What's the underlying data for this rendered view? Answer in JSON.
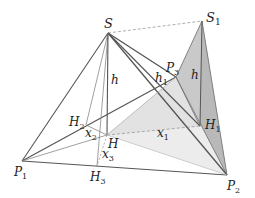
{
  "diagram": {
    "colors": {
      "edge": "#555555",
      "thin_edge": "#888888",
      "dashed": "#999999",
      "face_dark": "#c8c8c8",
      "face_light": "#ebebeb"
    },
    "points": {
      "S": {
        "label": "S",
        "sub": "",
        "x": 108,
        "y": 33
      },
      "S1": {
        "label": "S",
        "sub": "1",
        "x": 202,
        "y": 21
      },
      "P1": {
        "label": "P",
        "sub": "1",
        "x": 22,
        "y": 161
      },
      "P2": {
        "label": "P",
        "sub": "2",
        "x": 227,
        "y": 175
      },
      "P3": {
        "label": "P",
        "sub": "3",
        "x": 176,
        "y": 77
      },
      "H": {
        "label": "H",
        "sub": "",
        "x": 107,
        "y": 135
      },
      "H1": {
        "label": "H",
        "sub": "1",
        "x": 200,
        "y": 126
      },
      "H2": {
        "label": "H",
        "sub": "2",
        "x": 86,
        "y": 125
      },
      "H3": {
        "label": "H",
        "sub": "3",
        "x": 97,
        "y": 166
      }
    },
    "segment_labels": {
      "h_main": {
        "label": "h",
        "sub": ""
      },
      "h_S1": {
        "label": "h",
        "sub": ""
      },
      "h1": {
        "label": "h",
        "sub": "1"
      },
      "x1": {
        "label": "x",
        "sub": "1"
      },
      "x2": {
        "label": "x",
        "sub": "2"
      },
      "x3": {
        "label": "x",
        "sub": "3"
      }
    }
  }
}
